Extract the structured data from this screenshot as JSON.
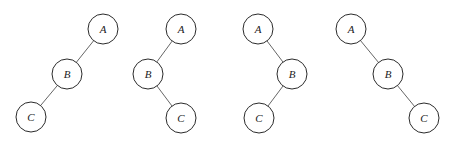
{
  "diagram": {
    "type": "binary-trees",
    "node_radius": 15,
    "trees": [
      {
        "name": "tree-1",
        "nodes": [
          {
            "id": "A",
            "label": "A",
            "x": 103,
            "y": 29
          },
          {
            "id": "B",
            "label": "B",
            "x": 67,
            "y": 74
          },
          {
            "id": "C",
            "label": "C",
            "x": 31,
            "y": 117
          }
        ],
        "edges": [
          [
            "A",
            "B"
          ],
          [
            "B",
            "C"
          ]
        ]
      },
      {
        "name": "tree-2",
        "nodes": [
          {
            "id": "A",
            "label": "A",
            "x": 181,
            "y": 29
          },
          {
            "id": "B",
            "label": "B",
            "x": 148,
            "y": 74
          },
          {
            "id": "C",
            "label": "C",
            "x": 181,
            "y": 118
          }
        ],
        "edges": [
          [
            "A",
            "B"
          ],
          [
            "B",
            "C"
          ]
        ]
      },
      {
        "name": "tree-3",
        "nodes": [
          {
            "id": "A",
            "label": "A",
            "x": 258,
            "y": 29
          },
          {
            "id": "B",
            "label": "B",
            "x": 292,
            "y": 74
          },
          {
            "id": "C",
            "label": "C",
            "x": 259,
            "y": 118
          }
        ],
        "edges": [
          [
            "A",
            "B"
          ],
          [
            "B",
            "C"
          ]
        ]
      },
      {
        "name": "tree-4",
        "nodes": [
          {
            "id": "A",
            "label": "A",
            "x": 351,
            "y": 29
          },
          {
            "id": "B",
            "label": "B",
            "x": 388,
            "y": 74
          },
          {
            "id": "C",
            "label": "C",
            "x": 424,
            "y": 118
          }
        ],
        "edges": [
          [
            "A",
            "B"
          ],
          [
            "B",
            "C"
          ]
        ]
      }
    ]
  }
}
